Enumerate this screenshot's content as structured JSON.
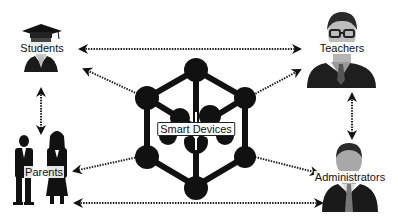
{
  "diagram": {
    "title": "",
    "hub": {
      "label": "Smart Devices",
      "icon": "network-hexagon-icon"
    },
    "nodes": {
      "students": {
        "label": "Students",
        "icon": "graduate-student-icon"
      },
      "teachers": {
        "label": "Teachers",
        "icon": "teacher-with-glasses-icon"
      },
      "parents": {
        "label": "Parents",
        "icon": "parents-couple-icon"
      },
      "administrators": {
        "label": "Administrators",
        "icon": "administrator-businessman-icon"
      }
    },
    "edges": [
      {
        "from": "students",
        "to": "teachers",
        "style": "dotted",
        "direction": "both"
      },
      {
        "from": "parents",
        "to": "administrators",
        "style": "dotted",
        "direction": "both"
      },
      {
        "from": "students",
        "to": "parents",
        "style": "dotted",
        "direction": "both"
      },
      {
        "from": "teachers",
        "to": "administrators",
        "style": "dotted",
        "direction": "both"
      },
      {
        "from": "smart_devices",
        "to": "students",
        "style": "dotted",
        "direction": "forward"
      },
      {
        "from": "smart_devices",
        "to": "teachers",
        "style": "dotted",
        "direction": "forward"
      },
      {
        "from": "smart_devices",
        "to": "parents",
        "style": "dotted",
        "direction": "forward"
      },
      {
        "from": "smart_devices",
        "to": "administrators",
        "style": "dotted",
        "direction": "forward"
      }
    ],
    "colors": {
      "ink": "#111111",
      "skin": "#c9c9c9",
      "suit": "#1a1a1a",
      "background": "#ffffff"
    }
  }
}
